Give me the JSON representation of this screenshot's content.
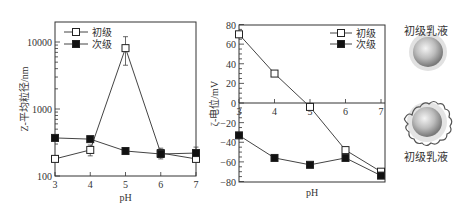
{
  "chart_data": [
    {
      "type": "line",
      "title": "",
      "xlabel": "pH",
      "ylabel": "Z-平均粒径/nm",
      "yscale": "log",
      "ylim": [
        100,
        20000
      ],
      "xlim": [
        3,
        7
      ],
      "x": [
        3,
        4,
        5,
        6,
        7
      ],
      "xticks": [
        "3",
        "4",
        "5",
        "6",
        "7"
      ],
      "yticks": [
        "100",
        "1000",
        "10000"
      ],
      "legend_position": "upper left",
      "grid": false,
      "series": [
        {
          "name": "初级",
          "marker": "open-square",
          "values": [
            180,
            245,
            8100,
            220,
            180
          ],
          "error_bars": true
        },
        {
          "name": "次级",
          "marker": "filled-square",
          "values": [
            370,
            355,
            236,
            213,
            220
          ],
          "error_bars": true
        }
      ]
    },
    {
      "type": "line",
      "title": "",
      "xlabel": "pH",
      "ylabel": "ζ-电位/mV",
      "ylim": [
        -80,
        80
      ],
      "xlim": [
        3,
        7
      ],
      "x": [
        3,
        4,
        5,
        6,
        7
      ],
      "xticks": [
        "3",
        "4",
        "5",
        "6",
        "7"
      ],
      "yticks": [
        "80",
        "60",
        "40",
        "20",
        "0",
        "-20",
        "-40",
        "-60",
        "-80"
      ],
      "legend_position": "upper right",
      "grid": false,
      "series": [
        {
          "name": "初级",
          "marker": "open-square",
          "values": [
            70,
            30,
            -4,
            -48,
            -70
          ]
        },
        {
          "name": "次级",
          "marker": "filled-square",
          "values": [
            -33,
            -56,
            -63,
            -56,
            -74
          ]
        }
      ]
    }
  ],
  "illustrations": {
    "top_caption": "初级乳液",
    "bottom_caption": "初级乳液"
  },
  "colors": {
    "axis": "#333333",
    "line": "#444444",
    "marker_fill_filled": "#111111",
    "marker_fill_open": "#ffffff",
    "droplet": "#bdbdbd"
  }
}
